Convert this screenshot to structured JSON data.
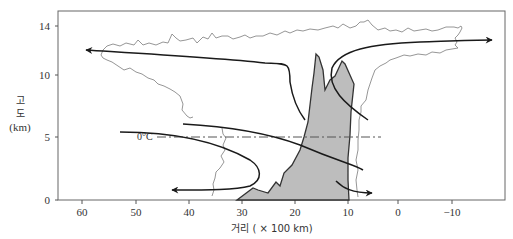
{
  "figure": {
    "type": "thunderstorm cross-section diagram",
    "y_axis": {
      "title_lines": [
        "고",
        "도",
        "(km)"
      ],
      "ticks": [
        "0",
        "5",
        "10",
        "14"
      ]
    },
    "x_axis": {
      "title": "거리 ( × 100 km)",
      "ticks": [
        "60",
        "50",
        "40",
        "30",
        "20",
        "10",
        "0",
        "−10"
      ]
    },
    "annotations": {
      "freezing_level": "0°C"
    },
    "colors": {
      "frame": "#555555",
      "cloud_outline": "#8a8a8a",
      "updraft_fill": "#bdbdbd",
      "updraft_outline": "#333333",
      "flow_arrows": "#1a1a1a",
      "isotherm": "#555555"
    }
  }
}
